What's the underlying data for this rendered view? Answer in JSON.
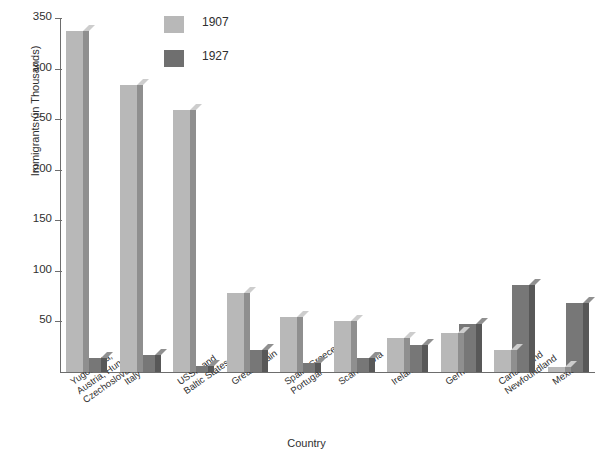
{
  "chart_data": {
    "type": "bar",
    "title": "",
    "xlabel": "Country",
    "ylabel": "Immigrants (in Thousands)",
    "ylim": [
      0,
      350
    ],
    "yticks": [
      50,
      100,
      150,
      200,
      250,
      300,
      350
    ],
    "ytick_labels": [
      "50",
      "100",
      "150",
      "200",
      "250",
      "300",
      "350"
    ],
    "grid": false,
    "legend_position": "top-center",
    "categories": [
      "Yugoslavia, Austria, Hungary Czechoslovakia",
      "Italy",
      "USSR and Baltic States",
      "Great Britain",
      "Spain, Greece, Portugal",
      "Scandinavia",
      "Ireland",
      "Germany",
      "Canada and Newfoundland",
      "Mexico"
    ],
    "category_lines": [
      [
        "Yugoslavia,",
        "Austria, Hungary",
        "Czechoslovakia"
      ],
      [
        "Italy"
      ],
      [
        "USSR and",
        "Baltic States"
      ],
      [
        "Great Britain"
      ],
      [
        "Spain, Greece,",
        "Portugal"
      ],
      [
        "Scandinavia"
      ],
      [
        "Ireland"
      ],
      [
        "Germany"
      ],
      [
        "Canada and",
        "Newfoundland"
      ],
      [
        "Mexico"
      ]
    ],
    "series": [
      {
        "name": "1907",
        "color": "#b8b8b8",
        "values": [
          337,
          284,
          259,
          78,
          54,
          50,
          34,
          39,
          22,
          5
        ]
      },
      {
        "name": "1927",
        "color": "#777777",
        "values": [
          14,
          17,
          6,
          22,
          9,
          14,
          27,
          47,
          86,
          68
        ]
      }
    ]
  },
  "legend": {
    "items": [
      {
        "label": "1907",
        "swatch_class": "y1907"
      },
      {
        "label": "1927",
        "swatch_class": "y1927"
      }
    ]
  },
  "axes": {
    "y_title": "Immigrants (in Thousands)",
    "x_title": "Country"
  }
}
